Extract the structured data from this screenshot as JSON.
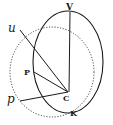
{
  "diagram": {
    "type": "geometric-construction",
    "ink_color": "#1a1a1a",
    "background": "#ffffff",
    "labels": {
      "V": "V",
      "u": "u",
      "P": "P",
      "C": "C",
      "p": "p",
      "K": "K"
    },
    "points": {
      "V": [
        70,
        10
      ],
      "u": [
        18,
        30
      ],
      "P": [
        33,
        72
      ],
      "C": [
        68,
        92
      ],
      "p": [
        18,
        100
      ],
      "K": [
        72,
        112
      ]
    },
    "shapes": [
      {
        "kind": "ellipse",
        "style": "solid",
        "cx": 68,
        "cy": 62,
        "rx": 36,
        "ry": 50
      },
      {
        "kind": "ellipse",
        "style": "dotted",
        "cx": 52,
        "cy": 72,
        "rx": 42,
        "ry": 45
      }
    ],
    "segments": [
      [
        "V",
        "C"
      ],
      [
        "u",
        "C"
      ],
      [
        "P",
        "C"
      ],
      [
        "p",
        "C"
      ]
    ]
  }
}
